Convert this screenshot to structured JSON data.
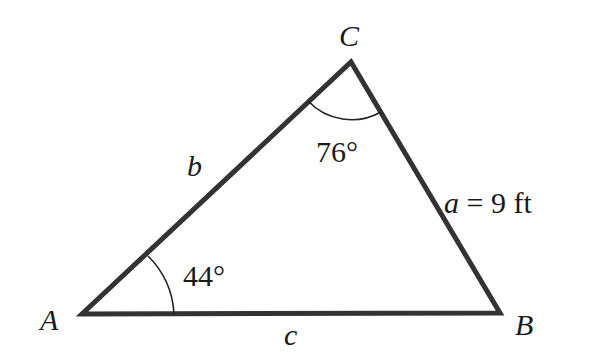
{
  "diagram": {
    "type": "triangle",
    "vertices": {
      "A": {
        "label": "A",
        "x": 82,
        "y": 314
      },
      "B": {
        "label": "B",
        "x": 500,
        "y": 313
      },
      "C": {
        "label": "C",
        "x": 351,
        "y": 62
      }
    },
    "sides": {
      "a": {
        "label": "a",
        "value_text": " = 9 ft"
      },
      "b": {
        "label": "b"
      },
      "c": {
        "label": "c"
      }
    },
    "angles": {
      "A": {
        "text": "44°"
      },
      "C": {
        "text": "76°"
      }
    },
    "colors": {
      "stroke": "#333333",
      "text": "#1a1a1a",
      "background": "#ffffff"
    }
  }
}
